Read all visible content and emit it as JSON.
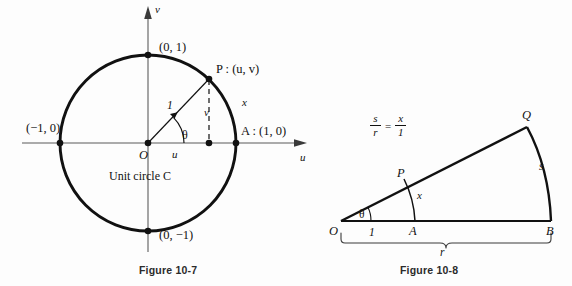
{
  "page": {
    "background_color": "#fdfdfd",
    "ink_color": "#111111",
    "axis_color": "#8a8a8a"
  },
  "figure_10_7": {
    "caption": "Figure 10-7",
    "axes": {
      "vertical_axis_label": "v",
      "horizontal_axis_label": "u"
    },
    "points": {
      "top": "(0, 1)",
      "bottom": "(0, −1)",
      "left": "(−1, 0)",
      "right": "A : (1, 0)",
      "on_circle": "P : (u, v)",
      "origin": "O"
    },
    "segments": {
      "radius": "1",
      "vertical_leg": "v",
      "horizontal_leg": "u",
      "angle": "θ",
      "arc_length": "x"
    },
    "annotation": "Unit circle C"
  },
  "figure_10_8": {
    "caption": "Figure 10-8",
    "equation": {
      "left_numerator": "s",
      "left_denominator": "r",
      "equals": "=",
      "right_numerator": "x",
      "right_denominator": "1"
    },
    "vertices": {
      "origin": "O",
      "inner_point": "A",
      "outer_point": "B",
      "inner_arc_point": "P",
      "outer_arc_point": "Q"
    },
    "segments": {
      "unit_segment": "1",
      "radius_brace": "r",
      "outer_arc": "s",
      "inner_arc": "x",
      "angle": "θ"
    }
  }
}
